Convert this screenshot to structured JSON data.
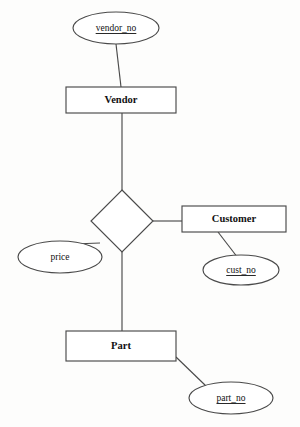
{
  "diagram": {
    "type": "er-diagram",
    "background_color": "#fdfdfc",
    "line_color": "#4a4a4a",
    "text_color": "#111111",
    "shape_fill": "#ffffff"
  },
  "entities": [
    {
      "id": "vendor",
      "label": "Vendor",
      "shape": "rectangle",
      "x": 66,
      "y": 87,
      "width": 110,
      "height": 26
    },
    {
      "id": "customer",
      "label": "Customer",
      "shape": "rectangle",
      "x": 182,
      "y": 206,
      "width": 104,
      "height": 26
    },
    {
      "id": "part",
      "label": "Part",
      "shape": "rectangle",
      "x": 66,
      "y": 331,
      "width": 110,
      "height": 30
    }
  ],
  "relationships": [
    {
      "id": "supplies",
      "label": "",
      "shape": "diamond",
      "cx": 122,
      "cy": 221,
      "rx": 31,
      "ry": 31
    }
  ],
  "attributes": [
    {
      "id": "vendor_no",
      "label": "vendor_no",
      "shape": "ellipse",
      "is_key": true,
      "cx": 116,
      "cy": 28,
      "rx": 43,
      "ry": 16,
      "attached_to": "vendor"
    },
    {
      "id": "price",
      "label": "price",
      "shape": "ellipse",
      "is_key": false,
      "cx": 60,
      "cy": 257,
      "rx": 42,
      "ry": 16,
      "attached_to": "supplies"
    },
    {
      "id": "cust_no",
      "label": "cust_no",
      "shape": "ellipse",
      "is_key": true,
      "cx": 241,
      "cy": 270,
      "rx": 38,
      "ry": 15,
      "attached_to": "customer"
    },
    {
      "id": "part_no",
      "label": "part_no",
      "shape": "ellipse",
      "is_key": true,
      "cx": 231,
      "cy": 398,
      "rx": 42,
      "ry": 16,
      "attached_to": "part"
    }
  ],
  "connectors": [
    {
      "id": "vendor_no-to-vendor",
      "from": "vendor_no",
      "to": "vendor",
      "x1": 116,
      "y1": 44,
      "x2": 121,
      "y2": 87
    },
    {
      "id": "vendor-to-supplies",
      "from": "vendor",
      "to": "supplies",
      "x1": 122,
      "y1": 113,
      "x2": 122,
      "y2": 190
    },
    {
      "id": "supplies-to-part",
      "from": "supplies",
      "to": "part",
      "x1": 122,
      "y1": 252,
      "x2": 122,
      "y2": 331
    },
    {
      "id": "supplies-to-customer",
      "from": "supplies",
      "to": "customer",
      "x1": 153,
      "y1": 221,
      "x2": 182,
      "y2": 221
    },
    {
      "id": "supplies-to-price",
      "from": "supplies",
      "to": "price",
      "x1": 100,
      "y1": 243,
      "x2": 73,
      "y2": 244
    },
    {
      "id": "customer-to-cust_no",
      "from": "customer",
      "to": "cust_no",
      "x1": 218,
      "y1": 232,
      "x2": 238,
      "y2": 258
    },
    {
      "id": "part-to-part_no",
      "from": "part",
      "to": "part_no",
      "x1": 176,
      "y1": 357,
      "x2": 206,
      "y2": 386
    }
  ]
}
